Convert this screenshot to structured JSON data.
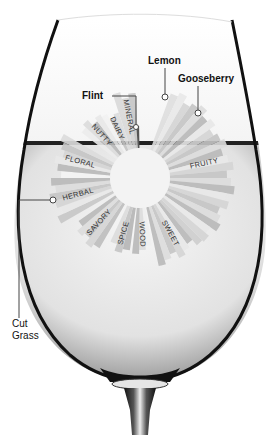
{
  "diagram": {
    "type": "aroma-wheel-in-wine-glass",
    "center": {
      "x": 140,
      "y": 178
    },
    "inner_radius": 30,
    "categories": [
      {
        "label": "MINERAL",
        "angle_start": -108,
        "angle_end": -93,
        "outer": 88,
        "color": "#d8d8d8"
      },
      {
        "label": "DAIRY",
        "angle_start": -122,
        "angle_end": -108,
        "outer": 75,
        "color": "#f2f2f2"
      },
      {
        "label": "NUTTY",
        "angle_start": -142,
        "angle_end": -122,
        "outer": 80,
        "color": "#ececec"
      },
      {
        "label": "FLORAL",
        "angle_start": -180,
        "angle_end": -150,
        "outer": 88,
        "color": "#f4f4f4"
      },
      {
        "label": "HERBAL",
        "angle_start": 150,
        "angle_end": 180,
        "outer": 92,
        "color": "#c6c6c6"
      },
      {
        "label": "SAVORY",
        "angle_start": 120,
        "angle_end": 145,
        "outer": 85,
        "color": "#bdbdbd"
      },
      {
        "label": "SPICE",
        "angle_start": 98,
        "angle_end": 115,
        "outer": 80,
        "color": "#b5b5b5"
      },
      {
        "label": "WOOD",
        "angle_start": 80,
        "angle_end": 96,
        "outer": 78,
        "color": "#f0f0f0"
      },
      {
        "label": "SWEET",
        "angle_start": 45,
        "angle_end": 78,
        "outer": 90,
        "color": "#cdcdcd"
      },
      {
        "label": "FRUITY",
        "angle_start": -70,
        "angle_end": 45,
        "outer": 95,
        "color": "#dedede"
      }
    ],
    "callouts": [
      {
        "label": "Flint",
        "x": 82,
        "y": 96
      },
      {
        "label": "Lemon",
        "x": 150,
        "y": 64
      },
      {
        "label": "Gooseberry",
        "x": 178,
        "y": 82
      },
      {
        "label": "Cut",
        "x": 12,
        "y": 327
      },
      {
        "label": "Grass",
        "x": 12,
        "y": 339
      }
    ]
  }
}
